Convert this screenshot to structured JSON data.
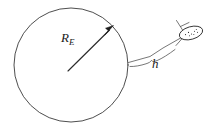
{
  "figure": {
    "background_color": "#ffffff",
    "line_color": "#3a3a3a",
    "label_color": "#1a1a1a",
    "width": 211,
    "height": 130
  },
  "labels": {
    "radius": {
      "symbol": "R",
      "subscript": "E",
      "meaning": "earth-radius"
    },
    "height": {
      "symbol": "h",
      "meaning": "satellite-altitude"
    }
  },
  "shapes": {
    "earth_circle": {
      "name": "earth-circle",
      "center_x": 71,
      "center_y": 65,
      "radius": 57
    },
    "radius_arrow": {
      "name": "radius-arrow",
      "from_x": 68,
      "from_y": 71,
      "to_x": 112,
      "to_y": 27
    },
    "altitude_line": {
      "name": "altitude-line",
      "from_x": 128,
      "from_y": 62,
      "to_x": 181,
      "to_y": 38
    },
    "brace": {
      "name": "altitude-brace"
    },
    "satellite": {
      "name": "satellite",
      "center_x": 191,
      "center_y": 33,
      "rx": 12,
      "ry": 6.5,
      "rotation": -16,
      "dot_count": 8
    }
  }
}
